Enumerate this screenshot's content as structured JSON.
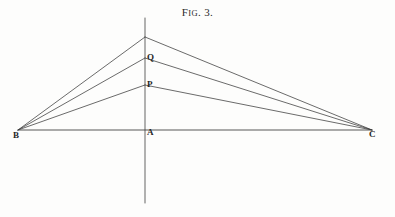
{
  "figure": {
    "caption_lead": "F",
    "caption_small": "IG",
    "caption_rest": ". 3.",
    "caption_full": "FIG. 3.",
    "background_color": "#fdfdfc",
    "ink_color": "#3a3a3a",
    "label_color": "#262626"
  },
  "points": {
    "apex": {
      "label": "",
      "x": 145,
      "y": 37
    },
    "q": {
      "label": "Q",
      "x": 145,
      "y": 58
    },
    "p": {
      "label": "P",
      "x": 145,
      "y": 85
    },
    "a": {
      "label": "A",
      "x": 145,
      "y": 128
    },
    "b": {
      "label": "B",
      "x": 18,
      "y": 130
    },
    "c": {
      "label": "C",
      "x": 372,
      "y": 130
    }
  },
  "chart_data": {
    "type": "line",
    "title": "FIG. 3.",
    "xlabel": "",
    "ylabel": "",
    "xlim": [
      0,
      395
    ],
    "ylim": [
      217,
      0
    ],
    "grid": false,
    "legend": "none",
    "annotations": [
      "B",
      "A",
      "C",
      "P",
      "Q"
    ],
    "series": [
      {
        "name": "baseline-BC",
        "x": [
          18,
          372
        ],
        "y": [
          130,
          130
        ]
      },
      {
        "name": "axis-vertical",
        "x": [
          145,
          145
        ],
        "y": [
          18,
          203
        ]
      },
      {
        "name": "B-to-apex",
        "x": [
          18,
          145
        ],
        "y": [
          130,
          37
        ]
      },
      {
        "name": "apex-to-C",
        "x": [
          145,
          372
        ],
        "y": [
          37,
          130
        ]
      },
      {
        "name": "B-to-Q",
        "x": [
          18,
          145
        ],
        "y": [
          130,
          58
        ]
      },
      {
        "name": "Q-to-C",
        "x": [
          145,
          372
        ],
        "y": [
          58,
          130
        ]
      },
      {
        "name": "B-to-P",
        "x": [
          18,
          145
        ],
        "y": [
          130,
          85
        ]
      },
      {
        "name": "P-to-C",
        "x": [
          145,
          372
        ],
        "y": [
          85,
          130
        ]
      }
    ]
  }
}
